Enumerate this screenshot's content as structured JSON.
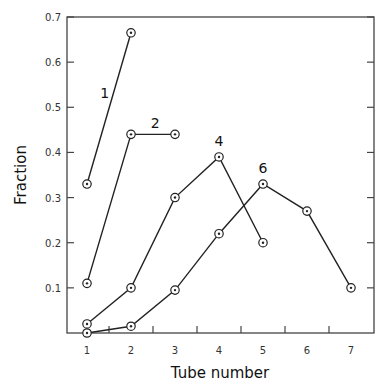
{
  "chart_data": {
    "type": "line",
    "title": "",
    "xlabel": "Tube number",
    "ylabel": "Fraction",
    "x": [
      1,
      2,
      3,
      4,
      5,
      6,
      7
    ],
    "xticklabels": [
      "1",
      "2",
      "3",
      "4",
      "5",
      "6",
      "7"
    ],
    "yticks": [
      0.1,
      0.2,
      0.3,
      0.4,
      0.5,
      0.6,
      0.7
    ],
    "yticklabels": [
      "0.1",
      "0.2",
      "0.3",
      "0.4",
      "0.5",
      "0.6",
      "0.7"
    ],
    "xlim": [
      0.55,
      7.5
    ],
    "ylim": [
      0,
      0.7
    ],
    "grid": false,
    "legend": "none (inline series labels)",
    "marker": "circle-dot",
    "series": [
      {
        "name": "1",
        "label": "1",
        "x": [
          1,
          2
        ],
        "values": [
          0.33,
          0.665
        ],
        "label_pos": [
          1.4,
          0.52
        ]
      },
      {
        "name": "2",
        "label": "2",
        "x": [
          1,
          2,
          3
        ],
        "values": [
          0.11,
          0.44,
          0.44
        ],
        "label_pos": [
          2.55,
          0.455
        ]
      },
      {
        "name": "4",
        "label": "4",
        "x": [
          1,
          2,
          3,
          4,
          5
        ],
        "values": [
          0.02,
          0.1,
          0.3,
          0.39,
          0.2
        ],
        "label_pos": [
          4.0,
          0.415
        ]
      },
      {
        "name": "6",
        "label": "6",
        "x": [
          1,
          2,
          3,
          4,
          5,
          6,
          7
        ],
        "values": [
          0.0,
          0.015,
          0.095,
          0.22,
          0.33,
          0.27,
          0.1
        ],
        "label_pos": [
          5.0,
          0.355
        ]
      }
    ],
    "colors": {
      "line": "#222222",
      "axis": "#444444",
      "background": "#ffffff"
    }
  }
}
